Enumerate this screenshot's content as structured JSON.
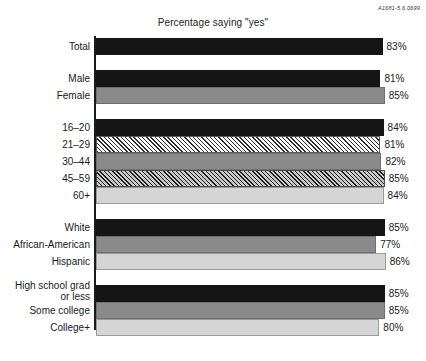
{
  "figure_code": "A1681-5.6.0699",
  "chart_data": {
    "type": "bar",
    "orientation": "horizontal",
    "title": "Percentage saying \"yes\"",
    "xlabel": "",
    "ylabel": "",
    "xlim": [
      60,
      90
    ],
    "grid": false,
    "legend": "none",
    "value_suffix": "%",
    "groups": [
      {
        "name": "total",
        "items": [
          {
            "label": "Total",
            "value": 83,
            "value_label": "83%",
            "fill": "black"
          }
        ]
      },
      {
        "name": "gender",
        "items": [
          {
            "label": "Male",
            "value": 81,
            "value_label": "81%",
            "fill": "black"
          },
          {
            "label": "Female",
            "value": 85,
            "value_label": "85%",
            "fill": "gray"
          }
        ]
      },
      {
        "name": "age",
        "items": [
          {
            "label": "16–20",
            "value": 84,
            "value_label": "84%",
            "fill": "black"
          },
          {
            "label": "21–29",
            "value": 81,
            "value_label": "81%",
            "fill": "hatch-light"
          },
          {
            "label": "30–44",
            "value": 82,
            "value_label": "82%",
            "fill": "gray"
          },
          {
            "label": "45–59",
            "value": 85,
            "value_label": "85%",
            "fill": "hatch-dark"
          },
          {
            "label": "60+",
            "value": 84,
            "value_label": "84%",
            "fill": "light"
          }
        ]
      },
      {
        "name": "race",
        "items": [
          {
            "label": "White",
            "value": 85,
            "value_label": "85%",
            "fill": "black"
          },
          {
            "label": "African-American",
            "value": 77,
            "value_label": "77%",
            "fill": "gray"
          },
          {
            "label": "Hispanic",
            "value": 86,
            "value_label": "86%",
            "fill": "light"
          }
        ]
      },
      {
        "name": "education",
        "items": [
          {
            "label": "High school grad\nor less",
            "value": 85,
            "value_label": "85%",
            "fill": "black"
          },
          {
            "label": "Some college",
            "value": 85,
            "value_label": "85%",
            "fill": "gray"
          },
          {
            "label": "College+",
            "value": 80,
            "value_label": "80%",
            "fill": "light"
          }
        ]
      }
    ]
  }
}
